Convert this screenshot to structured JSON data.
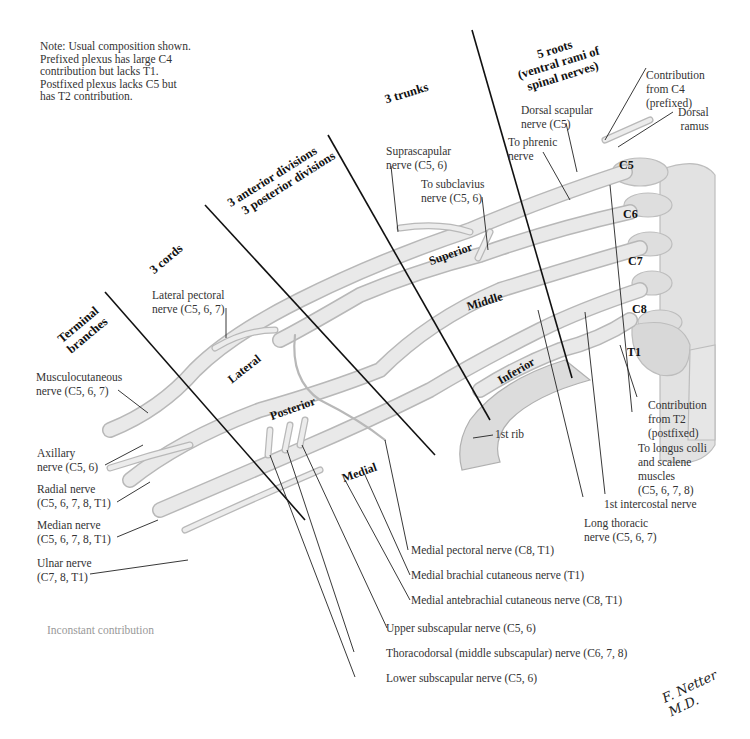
{
  "note": {
    "lines": [
      "Note: Usual composition shown.",
      "Prefixed plexus has large C4",
      "contribution but lacks T1.",
      "Postfixed plexus lacks C5 but",
      "has T2 contribution."
    ]
  },
  "section_headings": {
    "roots": [
      "5 roots",
      "(ventral rami of",
      "spinal nerves)"
    ],
    "trunks": "3 trunks",
    "divisions": [
      "3 anterior divisions",
      "3 posterior divisions"
    ],
    "cords": "3 cords",
    "terminal": [
      "Terminal",
      "branches"
    ]
  },
  "roots": [
    "C5",
    "C6",
    "C7",
    "C8",
    "T1"
  ],
  "trunks": [
    "Superior",
    "Middle",
    "Inferior"
  ],
  "cords": [
    "Lateral",
    "Posterior",
    "Medial"
  ],
  "labels": {
    "contribution_c4": [
      "Contribution",
      "from C4",
      "(prefixed)"
    ],
    "dorsal_ramus": [
      "Dorsal",
      "ramus"
    ],
    "dorsal_scapular": [
      "Dorsal scapular",
      "nerve (C5)"
    ],
    "to_phrenic": [
      "To phrenic",
      "nerve"
    ],
    "suprascapular": [
      "Suprascapular",
      "nerve (C5, 6)"
    ],
    "to_subclavius": [
      "To subclavius",
      "nerve (C5, 6)"
    ],
    "lateral_pectoral": [
      "Lateral pectoral",
      "nerve (C5, 6, 7)"
    ],
    "musculocutaneous": [
      "Musculocutaneous",
      "nerve (C5, 6, 7)"
    ],
    "axillary": [
      "Axillary",
      "nerve (C5, 6)"
    ],
    "radial": [
      "Radial nerve",
      "(C5, 6, 7,  8, T1)"
    ],
    "median": [
      "Median nerve",
      "(C5, 6, 7,  8, T1)"
    ],
    "ulnar": [
      "Ulnar nerve",
      "(C7, 8, T1)"
    ],
    "first_rib": "1st rib",
    "contribution_t2": [
      "Contribution",
      "from T2",
      "(postfixed)"
    ],
    "longus_colli": [
      "To longus colli",
      "and scalene",
      "muscles",
      "(C5, 6, 7,  8)"
    ],
    "first_intercostal": "1st intercostal nerve",
    "long_thoracic": [
      "Long thoracic",
      "nerve (C5, 6, 7)"
    ],
    "medial_pectoral": "Medial pectoral nerve (C8, T1)",
    "medial_brachial": "Medial brachial cutaneous nerve (T1)",
    "medial_antebrachial": "Medial antebrachial cutaneous nerve  (C8, T1)",
    "upper_subscapular": "Upper subscapular nerve (C5, 6)",
    "thoracodorsal": "Thoracodorsal (middle subscapular) nerve (C6, 7,  8)",
    "lower_subscapular": "Lower subscapular nerve (C5, 6)"
  },
  "legend": {
    "inconstant": "Inconstant contribution"
  },
  "signature": "F. Netter M.D.",
  "colors": {
    "nerve_fill": "#e6e6e6",
    "nerve_edge": "#b5b5b5",
    "bone": "#dcdcdc",
    "leader": "#222222"
  }
}
